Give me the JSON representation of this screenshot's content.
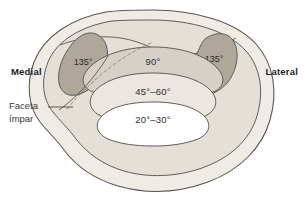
{
  "figure": {
    "background_color": "#ffffff"
  },
  "labels": {
    "medial": "Medial",
    "lateral": "Lateral",
    "callout_line1": "Faceta",
    "callout_line2": "ímpar"
  },
  "zones": [
    {
      "id": "facet-left",
      "label": "135°",
      "fill": "#b0a79b"
    },
    {
      "id": "facet-right",
      "label": "135°",
      "fill": "#b0a79b"
    },
    {
      "id": "band-90",
      "label": "90°",
      "fill": "#d6d1c8"
    },
    {
      "id": "band-45-60",
      "label": "45°–60°",
      "fill": "#ebe7e0"
    },
    {
      "id": "band-20-30",
      "label": "20°–30°",
      "fill": "#ffffff"
    }
  ],
  "colors": {
    "outline": "#59544e",
    "body_fill": "#efece6",
    "shell_fill": "#e4e0d8",
    "facet_fill": "#b0a79b",
    "band_90_fill": "#d6d1c8",
    "band_45_fill": "#ebe7e0",
    "band_20_fill": "#ffffff",
    "dashed_line": "#8d867d",
    "leader_line": "#4a4540",
    "text": "#2b2b2b"
  },
  "annotations": {
    "dashed_divider": "dashed line separating odd facet from medial facet",
    "leader": "leader line from 'Faceta ímpar' text to odd facet region"
  }
}
